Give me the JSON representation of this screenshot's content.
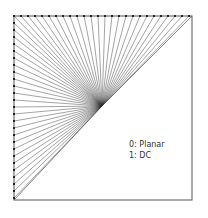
{
  "diagram": {
    "type": "radial-fan-line-diagram",
    "box": {
      "x0": 14,
      "y0": 16,
      "x1": 192,
      "y1": 200
    },
    "convergence_point": {
      "x": 102,
      "y": 106
    },
    "marker_spacing": 7,
    "colors": {
      "line": "#333333",
      "marker": "#222222",
      "border": "#555555",
      "background": "#ffffff"
    }
  },
  "legend": {
    "items": [
      {
        "label": "0: Planar"
      },
      {
        "label": "1: DC"
      }
    ]
  }
}
